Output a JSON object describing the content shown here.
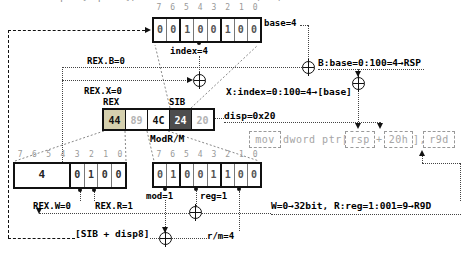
{
  "top_strip": {
    "text": "mov dword ptr [rsp+20h], r9d = 44 89 4C 24 20 (REX)"
  },
  "colors": {
    "rex_byte_bg": "#d5d0ae",
    "sib_byte_bg": "#4d4d4d",
    "dim_text": "#b3b3b3",
    "line": "#111"
  },
  "sib": {
    "bit_numbers": [
      "7",
      "6",
      "5",
      "4",
      "3",
      "2",
      "1",
      "0"
    ],
    "bits": [
      "0",
      "0",
      "1",
      "0",
      "0",
      "1",
      "0",
      "0"
    ],
    "index_label": "index=4",
    "base_label": "base=4"
  },
  "byte_row": {
    "rex_tag": "REX",
    "sib_tag": "SIB",
    "modrm_tag": "ModR/M",
    "bytes": [
      "44",
      "89",
      "4C",
      "24",
      "20"
    ]
  },
  "rex": {
    "bit_numbers": [
      "7",
      "6",
      "5",
      "4",
      "3",
      "2",
      "1",
      "0"
    ],
    "nibble": "4",
    "bits": [
      "0",
      "1",
      "0",
      "0"
    ],
    "w_label": "REX.W=0",
    "r_label": "REX.R=1"
  },
  "modrm": {
    "bit_numbers": [
      "7",
      "6",
      "5",
      "4",
      "3",
      "2",
      "1",
      "0"
    ],
    "bits": [
      "0",
      "1",
      "0",
      "0",
      "1",
      "1",
      "0",
      "0"
    ],
    "mod_label": "mod=1",
    "reg_label": "reg=1",
    "rm_label": "r/m=4"
  },
  "annotations": {
    "rex_b": "REX.B=0",
    "rex_x": "REX.X=0",
    "b_base": "B:base=0:100=4→RSP",
    "x_index": "X:index=0:100=4→[base]",
    "disp": "disp=0x20",
    "w_r": "W=0→32bit, R:reg=1:001=9→R9D",
    "sib_disp": "[SIB + disp8]"
  },
  "instruction": {
    "mov": "mov",
    "dword_ptr": "dword ptr[",
    "rsp": "rsp",
    "plus": "+",
    "disp": "20h",
    "close": "],",
    "r9d": "r9d"
  }
}
